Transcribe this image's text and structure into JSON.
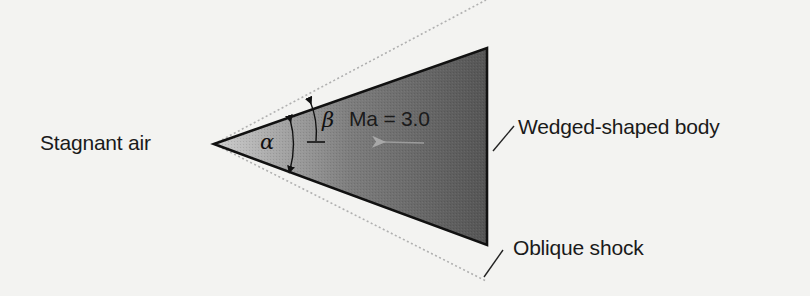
{
  "diagram": {
    "labels": {
      "upstream": "Stagnant air",
      "body": "Wedged-shaped body",
      "shock": "Oblique shock",
      "mach": "Ma = 3.0",
      "wedge_angle_symbol": "α",
      "shock_angle_symbol": "β"
    },
    "colors": {
      "background": "#f3f3f1",
      "wedge_fill_dark": "#5c5c5c",
      "wedge_fill_light": "#c8c8c8",
      "wedge_outline": "#111111",
      "shock_line": "#b4b4b4",
      "flow_arrow": "#9a9a9a",
      "text": "#1a1a1a"
    },
    "geometry": {
      "wedge_tip": [
        214,
        144
      ],
      "wedge_top_corner": [
        487,
        48
      ],
      "wedge_bottom_corner": [
        487,
        245
      ],
      "shock_upper_end": [
        486,
        0
      ],
      "shock_lower_end": [
        486,
        281
      ]
    }
  }
}
